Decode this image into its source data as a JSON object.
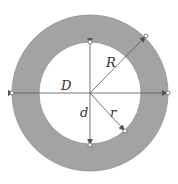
{
  "diagram": {
    "labels": {
      "outer_diameter": "D",
      "outer_radius": "R",
      "inner_diameter": "d",
      "inner_radius": "r"
    },
    "colors": {
      "ring_fill": "#a3a3a3",
      "ring_stroke": "#8a8a8a",
      "line": "#555555",
      "background": "#ffffff"
    }
  }
}
